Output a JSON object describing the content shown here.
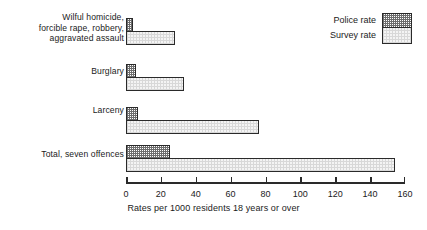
{
  "chart_data": {
    "type": "bar",
    "orientation": "horizontal",
    "title": "",
    "subtitle": "",
    "xlabel": "Rates per 1000 residents 18 years or over",
    "ylabel": "",
    "xlim": [
      0,
      160
    ],
    "xticks": [
      0,
      20,
      40,
      60,
      80,
      100,
      120,
      140,
      160
    ],
    "xtick_labels": [
      "0",
      "20",
      "40",
      "60",
      "80",
      "100",
      "120",
      "140",
      "160"
    ],
    "grid": false,
    "legend_position": "top-right",
    "categories": [
      "Wilful homicide,\nforcible rape, robbery,\naggravated assault",
      "Burglary",
      "Larceny",
      "Total, seven offences"
    ],
    "series": [
      {
        "name": "Police rate",
        "values": [
          4,
          6,
          7,
          25
        ],
        "fill": "dark-stipple",
        "color": "#6d6d6d"
      },
      {
        "name": "Survey rate",
        "values": [
          28,
          33,
          76,
          154
        ],
        "fill": "light-stipple",
        "color": "#f4f4f4"
      }
    ]
  },
  "axis": {
    "xlabel": "Rates per 1000 residents 18 years or over",
    "ticks": [
      {
        "value": 0,
        "label": "0"
      },
      {
        "value": 20,
        "label": "20"
      },
      {
        "value": 40,
        "label": "40"
      },
      {
        "value": 60,
        "label": "60"
      },
      {
        "value": 80,
        "label": "80"
      },
      {
        "value": 100,
        "label": "100"
      },
      {
        "value": 120,
        "label": "120"
      },
      {
        "value": 140,
        "label": "140"
      },
      {
        "value": 160,
        "label": "160"
      }
    ]
  },
  "categories": [
    {
      "label": "Wilful homicide,\nforcible rape, robbery,\naggravated assault"
    },
    {
      "label": "Burglary"
    },
    {
      "label": "Larceny"
    },
    {
      "label": "Total, seven offences"
    }
  ],
  "legend": {
    "items": [
      {
        "label": "Police rate"
      },
      {
        "label": "Survey rate"
      }
    ]
  },
  "colors": {
    "ink": "#1b1b1b",
    "outline": "#2a2a2a",
    "police_fill": "#6d6d6d",
    "survey_fill": "#f4f4f4",
    "background": "#ffffff"
  }
}
